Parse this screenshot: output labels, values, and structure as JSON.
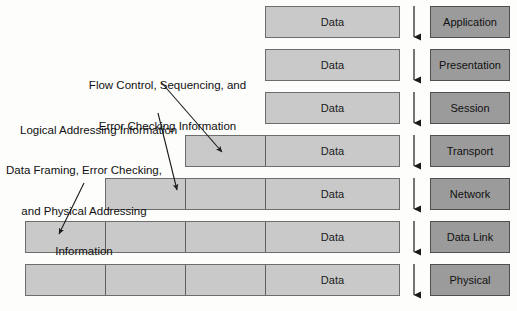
{
  "diagram": {
    "data_label": "Data",
    "colors": {
      "bar_fill": "#c9c9c9",
      "bar_border": "#6d6d6d",
      "layer_fill": "#9b9b9b",
      "layer_border": "#4f4f4f",
      "background": "#fdfdfc",
      "arrow": "#1a1a1a",
      "text": "#101010"
    },
    "layers": [
      {
        "name": "Application",
        "segments": 1,
        "data_label": "Data"
      },
      {
        "name": "Presentation",
        "segments": 1,
        "data_label": "Data"
      },
      {
        "name": "Session",
        "segments": 1,
        "data_label": "Data"
      },
      {
        "name": "Transport",
        "segments": 2,
        "data_label": "Data"
      },
      {
        "name": "Network",
        "segments": 3,
        "data_label": "Data"
      },
      {
        "name": "Data Link",
        "segments": 4,
        "data_label": "Data"
      },
      {
        "name": "Physical",
        "segments": 4,
        "data_label": "Data"
      }
    ],
    "annotations": [
      {
        "id": "flow-control",
        "line1": "Flow Control, Sequencing, and",
        "line2": "Error Checking Information",
        "points_to": "Transport"
      },
      {
        "id": "logical-addressing",
        "line1": "Logical Addressing Information",
        "line2": "",
        "points_to": "Network"
      },
      {
        "id": "data-framing",
        "line1": "Data Framing, Error Checking,",
        "line2": "and Physical Addressing",
        "line3": "Information",
        "points_to": "Data Link"
      }
    ],
    "flow_arrows": {
      "direction": "down",
      "count": 7,
      "label": "encapsulation-direction"
    }
  }
}
